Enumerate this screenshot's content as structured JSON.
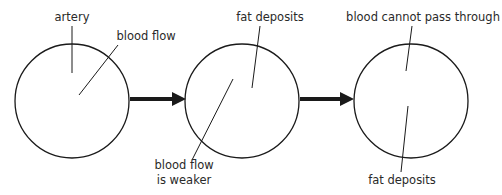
{
  "diagram": {
    "panels": [
      {
        "id": "healthy",
        "labels": {
          "artery": "artery",
          "flow": "blood flow"
        }
      },
      {
        "id": "narrowing",
        "labels": {
          "deposits": "fat deposits",
          "flow_line1": "blood flow",
          "flow_line2": "is weaker"
        }
      },
      {
        "id": "blocked",
        "labels": {
          "blocked": "blood cannot pass through",
          "deposits": "fat deposits"
        }
      }
    ],
    "colors": {
      "vessel_wall": "#b4b4b4",
      "vessel_fill": "#8f8f8f",
      "deposit": "#5e5e5e",
      "line": "#1a1a1a",
      "flow_arrow": "#ffffff"
    }
  }
}
